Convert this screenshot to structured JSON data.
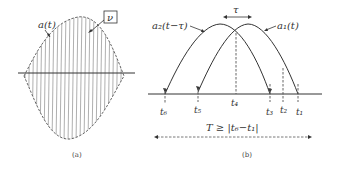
{
  "panel_a": {
    "caption": "(a)",
    "envelope_label": "a(t)",
    "carrier_label": "ν",
    "colors": {
      "line": "#333333",
      "hatch": "#9a9a9a"
    }
  },
  "panel_b": {
    "caption": "(b)",
    "curve_left_label": "a₂(t−τ)",
    "curve_right_label": "a₁(t)",
    "shift_label": "τ",
    "time_labels": {
      "t1": "t₁",
      "t2": "t₂",
      "t3": "t₃",
      "t4": "t₄",
      "t5": "t₅",
      "t6": "t₆"
    },
    "condition_label": "T ≥ |t₆−t₁|"
  }
}
